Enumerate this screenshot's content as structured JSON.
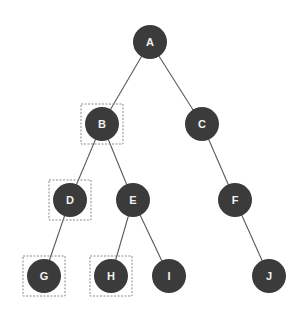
{
  "diagram": {
    "type": "binary-tree",
    "node_radius": 17,
    "colors": {
      "node_fill": "#3b3b3b",
      "node_text": "#f2f2f2",
      "edge": "#5a5a5a",
      "highlight_border": "#8a8a8a",
      "background": "#ffffff"
    },
    "nodes": [
      {
        "id": "A",
        "label": "A",
        "x": 150,
        "y": 42,
        "highlighted": false
      },
      {
        "id": "B",
        "label": "B",
        "x": 102,
        "y": 124,
        "highlighted": true
      },
      {
        "id": "C",
        "label": "C",
        "x": 202,
        "y": 124,
        "highlighted": false
      },
      {
        "id": "D",
        "label": "D",
        "x": 70,
        "y": 200,
        "highlighted": true
      },
      {
        "id": "E",
        "label": "E",
        "x": 133,
        "y": 200,
        "highlighted": false
      },
      {
        "id": "F",
        "label": "F",
        "x": 235,
        "y": 200,
        "highlighted": false
      },
      {
        "id": "G",
        "label": "G",
        "x": 44,
        "y": 276,
        "highlighted": true
      },
      {
        "id": "H",
        "label": "H",
        "x": 111,
        "y": 276,
        "highlighted": true
      },
      {
        "id": "I",
        "label": "I",
        "x": 169,
        "y": 276,
        "highlighted": false
      },
      {
        "id": "J",
        "label": "J",
        "x": 269,
        "y": 276,
        "highlighted": false
      }
    ],
    "edges": [
      {
        "from": "A",
        "to": "B"
      },
      {
        "from": "A",
        "to": "C"
      },
      {
        "from": "B",
        "to": "D"
      },
      {
        "from": "B",
        "to": "E"
      },
      {
        "from": "C",
        "to": "F"
      },
      {
        "from": "D",
        "to": "G"
      },
      {
        "from": "E",
        "to": "H"
      },
      {
        "from": "E",
        "to": "I"
      },
      {
        "from": "F",
        "to": "J"
      }
    ]
  }
}
